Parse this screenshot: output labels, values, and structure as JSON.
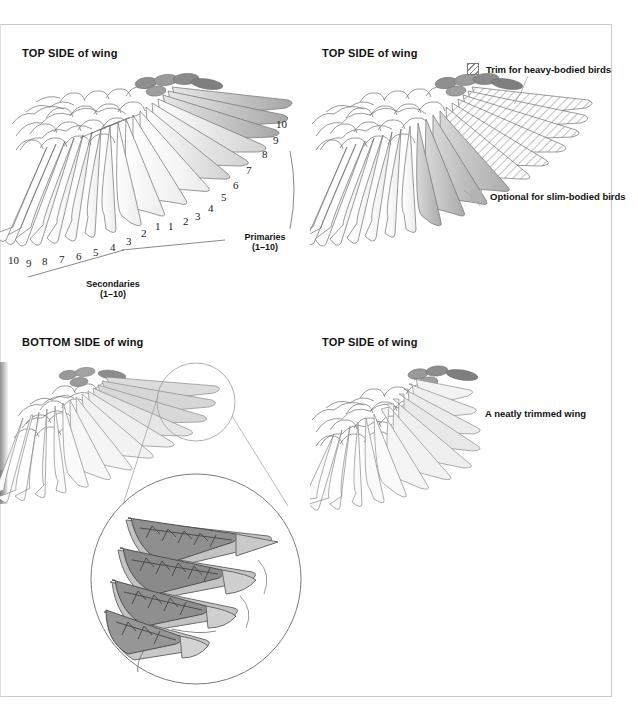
{
  "document": {
    "kind": "instructional-diagram",
    "subject": "Bird wing feather trimming guide",
    "panel_count": 4
  },
  "panels": [
    {
      "id": "top-left",
      "title_bold": "TOP SIDE",
      "title_rest": " of wing",
      "title_full": "TOP SIDE of wing",
      "axes": [
        {
          "name": "primaries",
          "label_line1": "Primaries",
          "label_line2": "(1–10)",
          "ticks": [
            "1",
            "2",
            "3",
            "4",
            "5",
            "6",
            "7",
            "8",
            "9",
            "10"
          ]
        },
        {
          "name": "secondaries",
          "label_line1": "Secondaries",
          "label_line2": "(1–10)",
          "ticks": [
            "1",
            "2",
            "3",
            "4",
            "5",
            "6",
            "7",
            "8",
            "9",
            "10"
          ]
        }
      ]
    },
    {
      "id": "top-right",
      "title_bold": "TOP SIDE",
      "title_rest": " of wing",
      "title_full": "TOP SIDE of wing",
      "legend": [
        {
          "swatch": "hatch",
          "label": "Trim for heavy-bodied birds",
          "color": "#ffffff"
        },
        {
          "swatch": "solid",
          "label": "Optional for slim-bodied birds",
          "color": "#b3b3b3"
        }
      ]
    },
    {
      "id": "bottom-left",
      "title_bold": "BOTTOM SIDE",
      "title_rest": " of wing",
      "title_full": "BOTTOM SIDE of wing",
      "callouts": [
        {
          "line1": "Top feathers",
          "line2": "not trimmed"
        },
        {
          "line1": "Bottom feather",
          "line2": "trimmed"
        }
      ]
    },
    {
      "id": "bottom-right",
      "title_bold": "TOP SIDE",
      "title_rest": " of wing",
      "title_full": "TOP SIDE of wing",
      "caption": "A neatly trimmed wing"
    }
  ],
  "colors": {
    "page_background": "#ffffff",
    "frame_border": "#c9c9c9",
    "feather_outline": "#6e6e6e",
    "feather_light": "#f2f2f2",
    "feather_mid": "#cfcfcf",
    "feather_dark": "#9a9a9a",
    "covert_dark": "#8b8b8b",
    "detail_dark": "#6f6f6f",
    "text": "#111111"
  }
}
